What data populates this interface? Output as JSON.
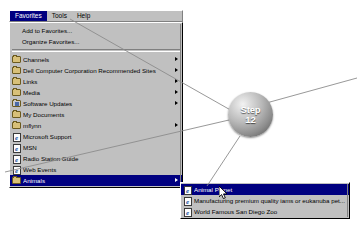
{
  "window": {
    "background_color": "#ffffff",
    "menu_face_color": "#c0c0c0",
    "highlight_color": "#000080"
  },
  "menubar": {
    "items": [
      {
        "label": "Favorites",
        "selected": true
      },
      {
        "label": "Tools",
        "selected": false
      },
      {
        "label": "Help",
        "selected": false
      }
    ]
  },
  "favorites_menu": {
    "commands": [
      {
        "label": "Add to Favorites...",
        "icon": "none",
        "submenu": false
      },
      {
        "label": "Organize Favorites...",
        "icon": "none",
        "submenu": false
      }
    ],
    "folders": [
      {
        "label": "Channels",
        "icon": "folder-icon",
        "submenu": true,
        "highlighted": false
      },
      {
        "label": "Dell Computer Corporation Recommended Sites",
        "icon": "folder-icon",
        "submenu": true,
        "highlighted": false
      },
      {
        "label": "Links",
        "icon": "folder-icon",
        "submenu": true,
        "highlighted": false
      },
      {
        "label": "Media",
        "icon": "folder-icon",
        "submenu": true,
        "highlighted": false
      },
      {
        "label": "Software Updates",
        "icon": "folder-special-icon",
        "submenu": true,
        "highlighted": false
      },
      {
        "label": "My Documents",
        "icon": "folder-icon",
        "submenu": false,
        "highlighted": false
      },
      {
        "label": "mflynn",
        "icon": "folder-icon",
        "submenu": true,
        "highlighted": false
      },
      {
        "label": "Microsoft Support",
        "icon": "ie-page-icon",
        "submenu": false,
        "highlighted": false
      },
      {
        "label": "MSN",
        "icon": "ie-page-icon",
        "submenu": false,
        "highlighted": false
      },
      {
        "label": "Radio Station Guide",
        "icon": "ie-page-icon",
        "submenu": false,
        "highlighted": false
      },
      {
        "label": "Web Events",
        "icon": "ie-page-icon",
        "submenu": false,
        "highlighted": false
      },
      {
        "label": "Animals",
        "icon": "folder-icon",
        "submenu": true,
        "highlighted": true
      }
    ]
  },
  "animals_submenu": {
    "items": [
      {
        "label": "Animal Planet",
        "icon": "ie-page-icon",
        "highlighted": true
      },
      {
        "label": "Manufacturing premium quality iams or eukanuba pet...",
        "icon": "ie-page-icon",
        "highlighted": false
      },
      {
        "label": "World Famous San Diego Zoo",
        "icon": "ie-page-icon",
        "highlighted": false
      }
    ]
  },
  "callout": {
    "word": "Step",
    "number": "12"
  }
}
